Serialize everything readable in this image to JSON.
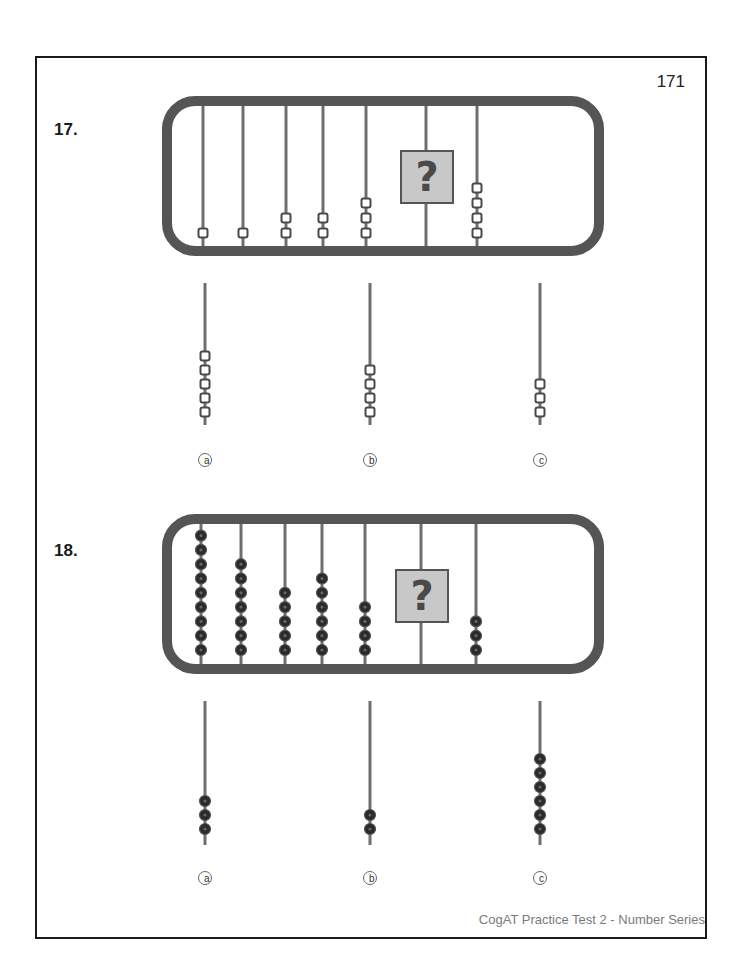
{
  "page": {
    "number": "171",
    "footer": "CogAT Practice Test 2 - Number Series"
  },
  "colors": {
    "frame": "#555555",
    "rod": "#6e6e6e",
    "bead_outline": "#4a4a4a",
    "bead_fill_hollow": "#ffffff",
    "bead_fill_solid": "#2a2a2a",
    "question_box_fill": "#c8c8c8",
    "question_box_border": "#555555",
    "question_mark": "#4a4a4a"
  },
  "questions": [
    {
      "label": "17.",
      "bead_style": "hollow-square",
      "rods": [
        {
          "beads": 1
        },
        {
          "beads": 1
        },
        {
          "beads": 2
        },
        {
          "beads": 2
        },
        {
          "beads": 3
        },
        {
          "beads": null,
          "unknown": true,
          "symbol": "?"
        },
        {
          "beads": 4
        }
      ],
      "options": [
        {
          "letter": "a",
          "beads": 5
        },
        {
          "letter": "b",
          "beads": 4
        },
        {
          "letter": "c",
          "beads": 3
        }
      ]
    },
    {
      "label": "18.",
      "bead_style": "solid-round",
      "rods": [
        {
          "beads": 9
        },
        {
          "beads": 7
        },
        {
          "beads": 5
        },
        {
          "beads": 6
        },
        {
          "beads": 4
        },
        {
          "beads": null,
          "unknown": true,
          "symbol": "?"
        },
        {
          "beads": 3
        }
      ],
      "options": [
        {
          "letter": "a",
          "beads": 3
        },
        {
          "letter": "b",
          "beads": 2
        },
        {
          "letter": "c",
          "beads": 6
        }
      ]
    }
  ]
}
